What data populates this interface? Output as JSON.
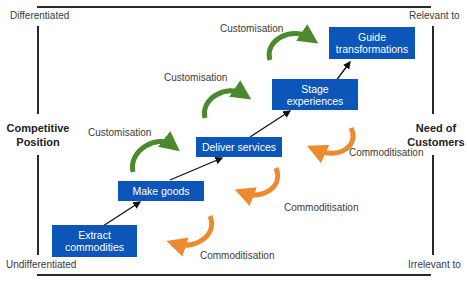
{
  "diagram": {
    "axes": {
      "left": {
        "top_label": "Differentiated",
        "title_line1": "Competitive",
        "title_line2": "Position",
        "bottom_label": "Undifferentiated"
      },
      "right": {
        "top_label": "Relevant to",
        "title_line1": "Need of",
        "title_line2": "Customers",
        "bottom_label": "Irrelevant to"
      }
    },
    "stages": [
      {
        "line1": "Extract",
        "line2": "commodities"
      },
      {
        "line1": "Make goods",
        "line2": ""
      },
      {
        "line1": "Deliver services",
        "line2": ""
      },
      {
        "line1": "Stage",
        "line2": "experiences"
      },
      {
        "line1": "Guide",
        "line2": "transformations"
      }
    ],
    "customisation_labels": [
      "Customisation",
      "Customisation",
      "Customisation"
    ],
    "commoditisation_labels": [
      "Commoditisation",
      "Commoditisation",
      "Commoditisation"
    ],
    "colors": {
      "box": "#0b56b8",
      "customisation_arrow": "#4a8a2c",
      "commoditisation_arrow": "#ee8a2e",
      "frame": "#2a2a2a"
    }
  }
}
